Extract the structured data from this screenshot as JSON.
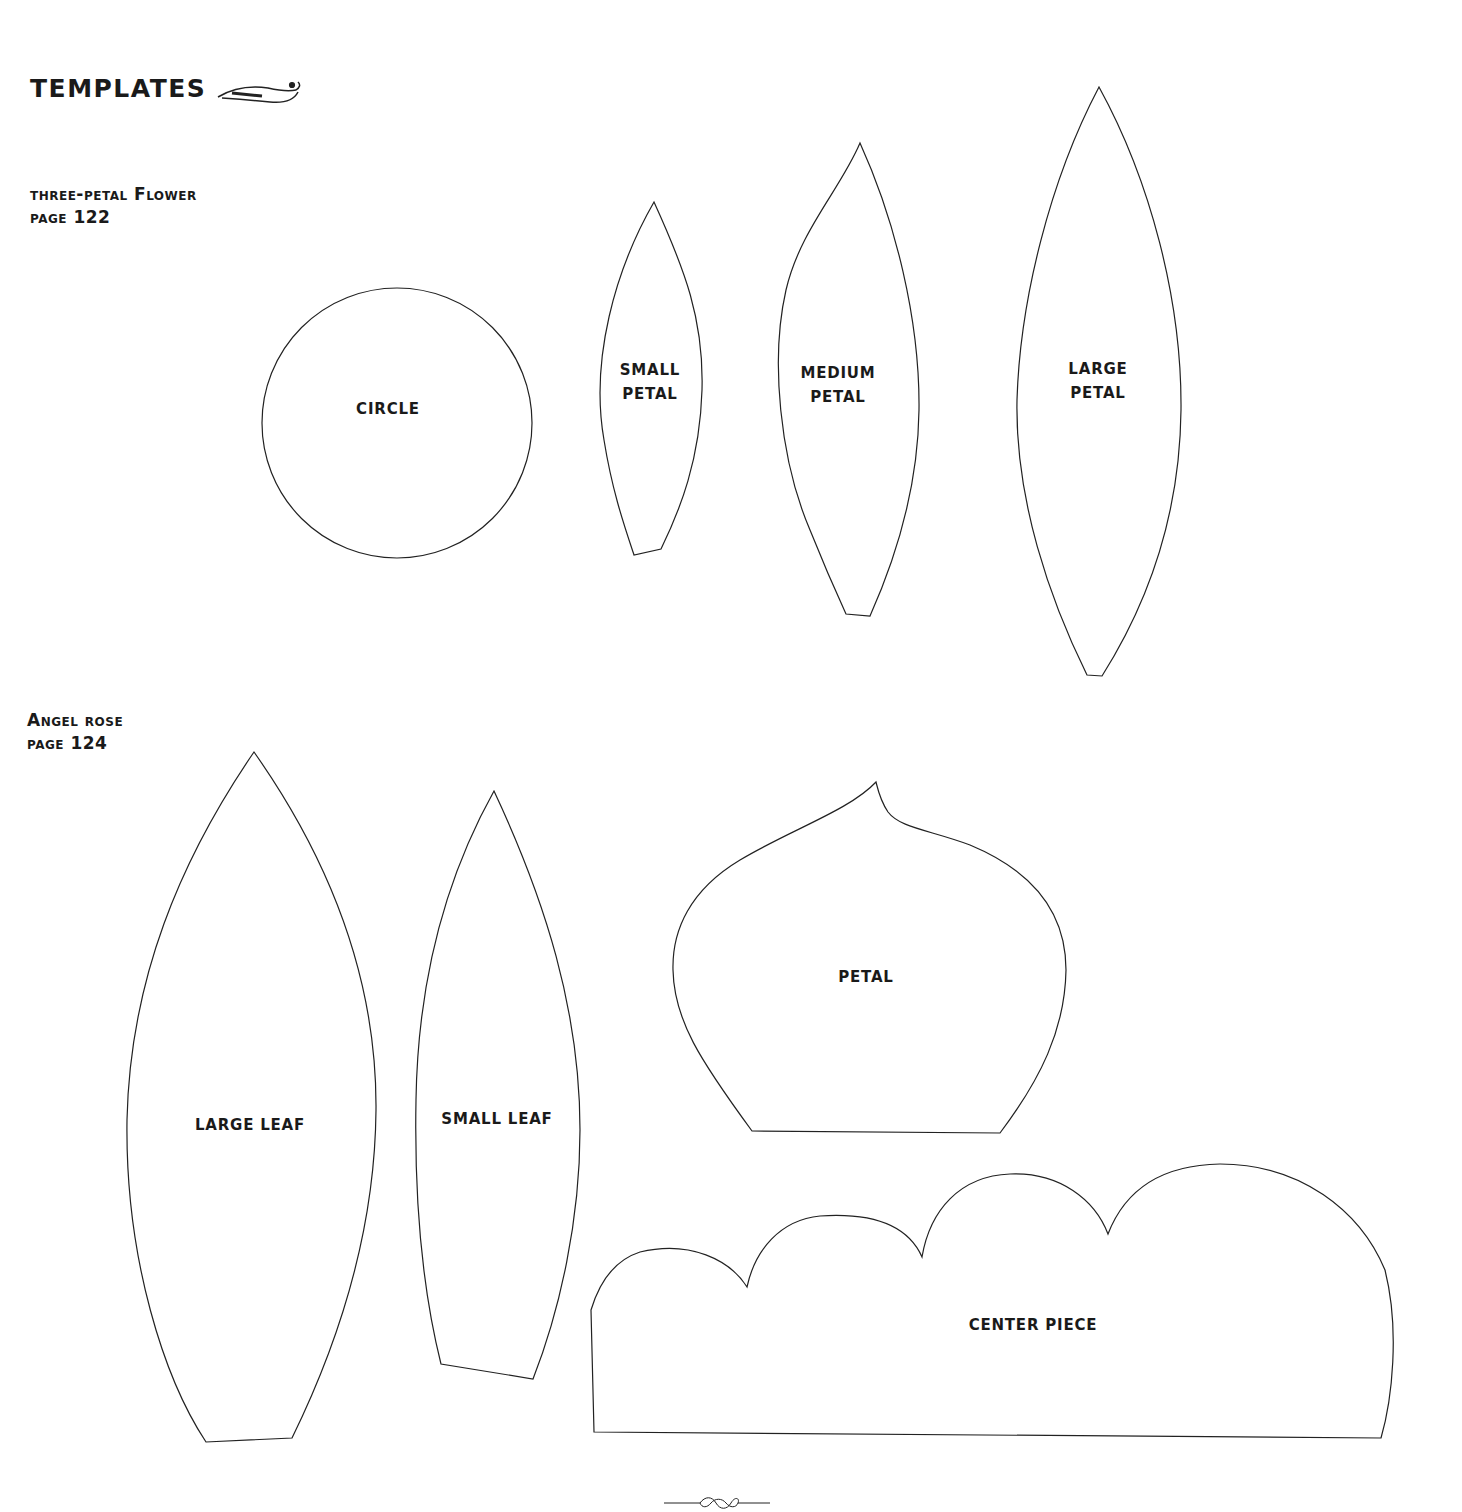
{
  "page": {
    "title": "TEMPLATES",
    "title_ornament": "flourish-ornament",
    "footer_ornament": "scroll-divider-ornament"
  },
  "sections": [
    {
      "heading": "three-petal Flower",
      "page_ref": "page 122",
      "templates": [
        {
          "label_line1": "CIRCLE",
          "label_line2": ""
        },
        {
          "label_line1": "SMALL",
          "label_line2": "PETAL"
        },
        {
          "label_line1": "MEDIUM",
          "label_line2": "PETAL"
        },
        {
          "label_line1": "LARGE",
          "label_line2": "PETAL"
        }
      ]
    },
    {
      "heading": "Angel rose",
      "page_ref": "page 124",
      "templates": [
        {
          "label_line1": "LARGE LEAF"
        },
        {
          "label_line1": "SMALL LEAF"
        },
        {
          "label_line1": "PETAL"
        },
        {
          "label_line1": "CENTER PIECE"
        }
      ]
    }
  ]
}
